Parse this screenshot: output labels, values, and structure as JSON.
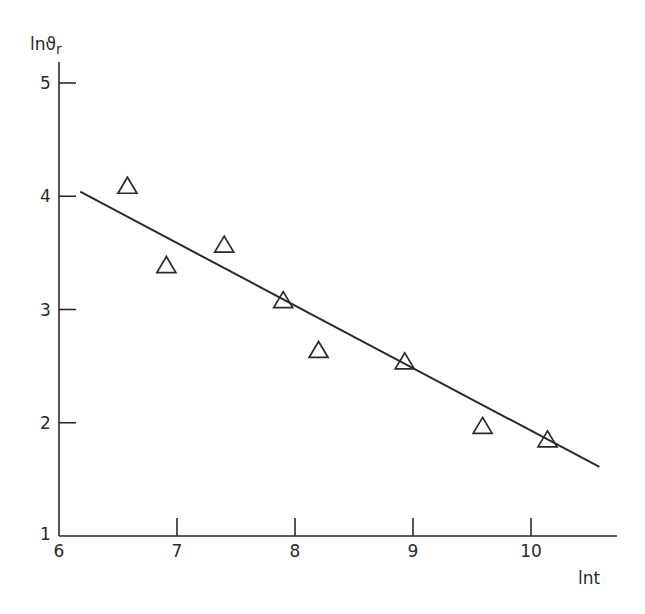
{
  "chart_data": {
    "type": "scatter",
    "title": "",
    "xlabel": "lnt",
    "ylabel": "lnϑr",
    "ylabel_main": "lnϑ",
    "ylabel_sub": "r",
    "xlim": [
      6,
      10.8
    ],
    "ylim": [
      1,
      5.2
    ],
    "x_ticks": [
      6,
      7,
      8,
      9,
      10
    ],
    "y_ticks": [
      1,
      2,
      3,
      4,
      5
    ],
    "x_tick_labels": [
      "6",
      "7",
      "8",
      "9",
      "10"
    ],
    "y_tick_labels": [
      "1",
      "2",
      "3",
      "4",
      "5"
    ],
    "grid": false,
    "legend": null,
    "series": [
      {
        "name": "observations",
        "marker": "open-triangle",
        "x": [
          6.58,
          6.91,
          7.4,
          7.9,
          8.2,
          8.93,
          9.59,
          10.14
        ],
        "y": [
          4.09,
          3.39,
          3.57,
          3.08,
          2.64,
          2.54,
          1.97,
          1.85
        ]
      },
      {
        "name": "fit-line",
        "type": "line",
        "x": [
          6.18,
          10.58
        ],
        "y": [
          4.04,
          1.61
        ]
      }
    ]
  },
  "colors": {
    "ink": "#2a2a2a",
    "background": "#ffffff"
  }
}
